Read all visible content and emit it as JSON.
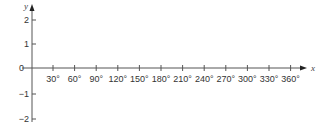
{
  "chart_data": {
    "type": "line",
    "title": "",
    "xlabel": "x",
    "ylabel": "y",
    "x_ticks": [
      "30°",
      "60°",
      "90°",
      "120°",
      "150°",
      "180°",
      "210°",
      "240°",
      "270°",
      "300°",
      "330°",
      "360°"
    ],
    "x_values": [
      30,
      60,
      90,
      120,
      150,
      180,
      210,
      240,
      270,
      300,
      330,
      360
    ],
    "y_ticks": [
      "2",
      "1",
      "0",
      "−1",
      "−2"
    ],
    "y_values": [
      2,
      1,
      0,
      -1,
      -2
    ],
    "xlim": [
      0,
      360
    ],
    "ylim": [
      -2,
      2
    ],
    "series": [],
    "grid": false,
    "legend": null
  },
  "colors": {
    "axis": "#555555",
    "text": "#333333"
  }
}
